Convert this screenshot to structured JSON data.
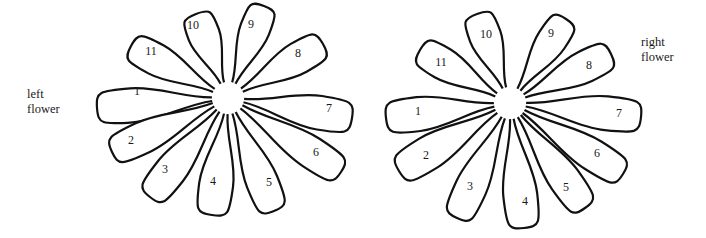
{
  "diagram": {
    "type": "illustration",
    "colors": {
      "stroke": "#111111",
      "fill": "#ffffff",
      "text": "#1a1a1a",
      "background": "#ffffff"
    }
  },
  "labels": {
    "left": {
      "line1": "left",
      "line2": "flower"
    },
    "right": {
      "line1": "right",
      "line2": "flower"
    }
  },
  "flowers": [
    {
      "id": "left",
      "name": "left flower",
      "center": [
        228,
        98
      ],
      "inner_radius": 16,
      "petals": [
        {
          "label": "1",
          "tip": [
            97,
            108
          ],
          "width": 34,
          "text_pos": [
            137,
            91
          ]
        },
        {
          "label": "2",
          "tip": [
            112,
            152
          ],
          "width": 32,
          "text_pos": [
            131,
            140
          ]
        },
        {
          "label": "3",
          "tip": [
            150,
            197
          ],
          "width": 32,
          "text_pos": [
            165,
            169
          ]
        },
        {
          "label": "4",
          "tip": [
            212,
            215
          ],
          "width": 34,
          "text_pos": [
            213,
            181
          ]
        },
        {
          "label": "5",
          "tip": [
            274,
            211
          ],
          "width": 32,
          "text_pos": [
            269,
            182
          ]
        },
        {
          "label": "6",
          "tip": [
            341,
            172
          ],
          "width": 32,
          "text_pos": [
            316,
            152
          ]
        },
        {
          "label": "7",
          "tip": [
            352,
            118
          ],
          "width": 34,
          "text_pos": [
            329,
            108
          ]
        },
        {
          "label": "8",
          "tip": [
            323,
            44
          ],
          "width": 32,
          "text_pos": [
            298,
            53
          ]
        },
        {
          "label": "9",
          "tip": [
            264,
            6
          ],
          "width": 30,
          "text_pos": [
            251,
            24
          ]
        },
        {
          "label": "10",
          "tip": [
            196,
            14
          ],
          "width": 32,
          "text_pos": [
            193,
            25
          ]
        },
        {
          "label": "11",
          "tip": [
            131,
            46
          ],
          "width": 32,
          "text_pos": [
            151,
            51
          ]
        }
      ]
    },
    {
      "id": "right",
      "name": "right flower",
      "center": [
        510,
        103
      ],
      "inner_radius": 16,
      "petals": [
        {
          "label": "1",
          "tip": [
            386,
            118
          ],
          "width": 34,
          "text_pos": [
            418,
            111
          ]
        },
        {
          "label": "2",
          "tip": [
            399,
            171
          ],
          "width": 34,
          "text_pos": [
            426,
            155
          ]
        },
        {
          "label": "3",
          "tip": [
            457,
            218
          ],
          "width": 32,
          "text_pos": [
            470,
            186
          ]
        },
        {
          "label": "4",
          "tip": [
            524,
            228
          ],
          "width": 34,
          "text_pos": [
            525,
            201
          ]
        },
        {
          "label": "5",
          "tip": [
            585,
            208
          ],
          "width": 32,
          "text_pos": [
            566,
            187
          ]
        },
        {
          "label": "6",
          "tip": [
            623,
            174
          ],
          "width": 32,
          "text_pos": [
            597,
            153
          ]
        },
        {
          "label": "7",
          "tip": [
            641,
            117
          ],
          "width": 34,
          "text_pos": [
            619,
            113
          ]
        },
        {
          "label": "8",
          "tip": [
            611,
            54
          ],
          "width": 32,
          "text_pos": [
            589,
            65
          ]
        },
        {
          "label": "9",
          "tip": [
            566,
            19
          ],
          "width": 30,
          "text_pos": [
            551,
            33
          ]
        },
        {
          "label": "10",
          "tip": [
            477,
            14
          ],
          "width": 32,
          "text_pos": [
            486,
            34
          ]
        },
        {
          "label": "11",
          "tip": [
            420,
            50
          ],
          "width": 32,
          "text_pos": [
            441,
            62
          ]
        }
      ]
    }
  ]
}
